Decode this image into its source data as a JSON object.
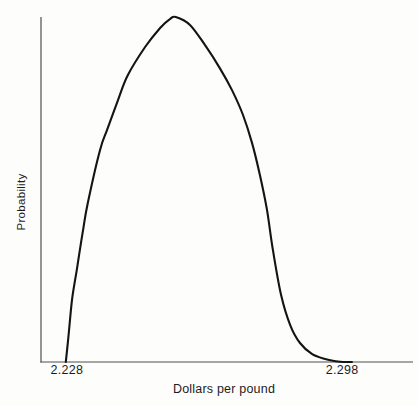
{
  "chart_data": {
    "type": "line",
    "title": "",
    "xlabel": "Dollars per pound",
    "ylabel": "Probability",
    "x_ticks": [
      2.228,
      2.298
    ],
    "x_tick_labels": [
      "2.228",
      "2.298"
    ],
    "xlim": [
      2.2214,
      2.3158
    ],
    "ylim": [
      0,
      1.0
    ],
    "grid": false,
    "legend": "none",
    "curve_color": "#141414",
    "axis_color": "#4f4f4f",
    "series": [
      {
        "name": "probability-density",
        "x": [
          2.2277,
          2.2283,
          2.2293,
          2.2305,
          2.2321,
          2.2333,
          2.2364,
          2.2382,
          2.241,
          2.2435,
          2.2479,
          2.2517,
          2.2542,
          2.2557,
          2.2593,
          2.2631,
          2.2669,
          2.27,
          2.2728,
          2.2751,
          2.2771,
          2.2789,
          2.2804,
          2.2825,
          2.2848,
          2.2873,
          2.2904,
          2.2937,
          2.2975,
          2.3005
        ],
        "y": [
          0.0,
          0.064,
          0.18,
          0.267,
          0.383,
          0.461,
          0.614,
          0.672,
          0.759,
          0.832,
          0.913,
          0.968,
          0.994,
          1.0,
          0.977,
          0.919,
          0.852,
          0.788,
          0.716,
          0.635,
          0.542,
          0.441,
          0.325,
          0.194,
          0.107,
          0.055,
          0.023,
          0.009,
          0.001,
          0.0
        ]
      }
    ]
  }
}
